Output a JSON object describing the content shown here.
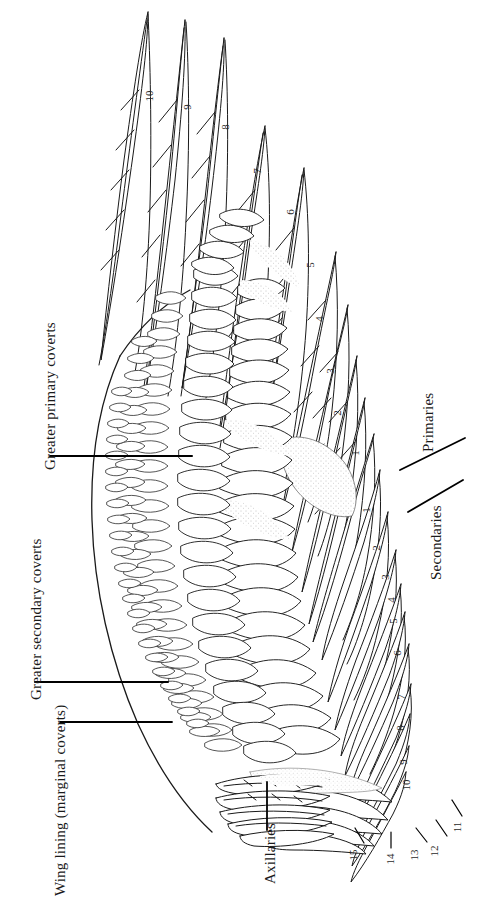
{
  "figure": {
    "background_color": "#ffffff",
    "ink_color": "#1a1a1a",
    "width": 487,
    "height": 900
  },
  "labels": {
    "greater_primary_coverts": "Greater primary coverts",
    "greater_secondary_coverts": "Greater secondary coverts",
    "wing_lining": "Wing lining (marginal coverts)",
    "axillaries": "Axillaries",
    "primaries": "Primaries",
    "secondaries": "Secondaries"
  },
  "primaries": {
    "name": "Primaries",
    "numbers": [
      "10",
      "9",
      "8",
      "7",
      "6",
      "5",
      "4",
      "3",
      "2",
      "1"
    ],
    "positions": [
      {
        "n": "10",
        "x": 149,
        "y": 97
      },
      {
        "n": "9",
        "x": 190,
        "y": 108
      },
      {
        "n": "8",
        "x": 228,
        "y": 128
      },
      {
        "n": "7",
        "x": 260,
        "y": 172
      },
      {
        "n": "6",
        "x": 293,
        "y": 213
      },
      {
        "n": "5",
        "x": 313,
        "y": 266
      },
      {
        "n": "4",
        "x": 322,
        "y": 320
      },
      {
        "n": "3",
        "x": 333,
        "y": 372
      },
      {
        "n": "2",
        "x": 340,
        "y": 414
      },
      {
        "n": "1",
        "x": 358,
        "y": 454
      }
    ]
  },
  "secondaries": {
    "name": "Secondaries",
    "numbers": [
      "1",
      "2",
      "3",
      "4",
      "5",
      "6",
      "7",
      "8",
      "9",
      "10",
      "11",
      "12",
      "13",
      "14",
      "15"
    ],
    "positions": [
      {
        "n": "1",
        "x": 369,
        "y": 511
      },
      {
        "n": "2",
        "x": 379,
        "y": 549
      },
      {
        "n": "3",
        "x": 388,
        "y": 578
      },
      {
        "n": "4",
        "x": 394,
        "y": 601
      },
      {
        "n": "5",
        "x": 396,
        "y": 622
      },
      {
        "n": "6",
        "x": 400,
        "y": 654
      },
      {
        "n": "7",
        "x": 404,
        "y": 698
      },
      {
        "n": "8",
        "x": 403,
        "y": 729
      },
      {
        "n": "9",
        "x": 406,
        "y": 763
      },
      {
        "n": "10",
        "x": 406,
        "y": 786
      }
    ],
    "callouts": [
      {
        "n": "11",
        "x": 458,
        "y": 828
      },
      {
        "n": "12",
        "x": 434,
        "y": 852
      },
      {
        "n": "13",
        "x": 414,
        "y": 856
      },
      {
        "n": "14",
        "x": 390,
        "y": 860
      },
      {
        "n": "15",
        "x": 353,
        "y": 856
      }
    ]
  }
}
